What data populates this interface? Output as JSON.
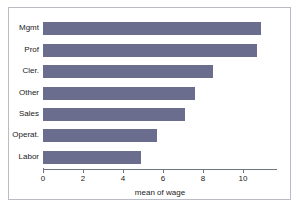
{
  "chart_data": {
    "type": "bar",
    "orientation": "horizontal",
    "title": "",
    "subtitle": "",
    "xlabel": "mean of wage",
    "ylabel": "",
    "categories": [
      "Mgmt",
      "Prof",
      "Cler.",
      "Other",
      "Sales",
      "Operat.",
      "Labor"
    ],
    "values": [
      10.9,
      10.7,
      8.5,
      7.6,
      7.1,
      5.7,
      4.9
    ],
    "xlim": [
      0,
      11.7
    ],
    "xticks": [
      0,
      2,
      4,
      6,
      8,
      10
    ],
    "xtick_labels": [
      "0",
      "2",
      "4",
      "6",
      "8",
      "10"
    ],
    "grid": false,
    "legend": null,
    "bar_color": "#6b6d8f",
    "axis_color": "#6f7480",
    "frame_color": "#b9bcc4",
    "background": "#ffffff"
  }
}
